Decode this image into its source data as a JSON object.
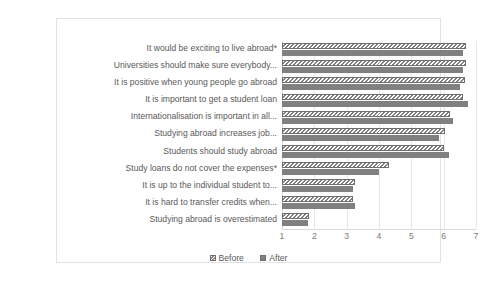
{
  "chart_data": {
    "type": "bar",
    "orientation": "horizontal",
    "title": "",
    "xlabel": "",
    "ylabel": "",
    "xlim": [
      1,
      7
    ],
    "xticks": [
      1,
      2,
      3,
      4,
      5,
      6,
      7
    ],
    "xtick_labels": [
      "1",
      "2",
      "3",
      "4",
      "5",
      "6",
      "7"
    ],
    "grid": true,
    "legend_position": "bottom",
    "categories": [
      "It would be exciting to live abroad*",
      "Universities should make sure everybody...",
      "It is positive when young people go abroad",
      "It is important to get a student loan",
      "Internationalisation is important in all...",
      "Studying abroad increases job...",
      "Students should study abroad",
      "Study loans do not cover the expenses*",
      "It is up to the individual student to...",
      "It is hard to transfer credits when...",
      "Studying abroad is overestimated"
    ],
    "series": [
      {
        "name": "Before",
        "color": "#ffffff",
        "pattern": "diagonal-hatch",
        "values": [
          6.7,
          6.7,
          6.65,
          6.6,
          6.2,
          6.05,
          6.0,
          4.3,
          3.25,
          3.2,
          1.85
        ]
      },
      {
        "name": "After",
        "color": "#808080",
        "pattern": "solid",
        "values": [
          6.6,
          6.6,
          6.5,
          6.75,
          6.3,
          5.85,
          6.15,
          4.0,
          3.2,
          3.25,
          1.8
        ]
      }
    ]
  },
  "legend": {
    "items": [
      {
        "label": "Before"
      },
      {
        "label": "After"
      }
    ]
  }
}
